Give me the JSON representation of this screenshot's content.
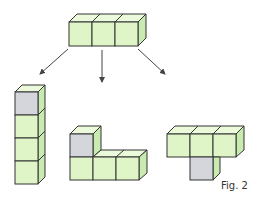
{
  "figure": {
    "caption": "Fig. 2",
    "colors": {
      "green_front": "#dff5c8",
      "green_top": "#eafadb",
      "green_side": "#c9eab0",
      "gray_front": "#d4d6dc",
      "gray_side": "#c4c7cf",
      "stroke": "#333333",
      "arrow": "#444444"
    },
    "source_shape": {
      "label": "Three cubes in a row",
      "cubes": 3
    },
    "results": [
      {
        "label": "Vertical tower of four cubes, top cube gray",
        "cubes": 4
      },
      {
        "label": "L-shape: three cubes in a row with gray cube on top of left",
        "cubes": 4
      },
      {
        "label": "T-shape: three cubes in a row with gray cube below middle",
        "cubes": 4
      }
    ]
  }
}
